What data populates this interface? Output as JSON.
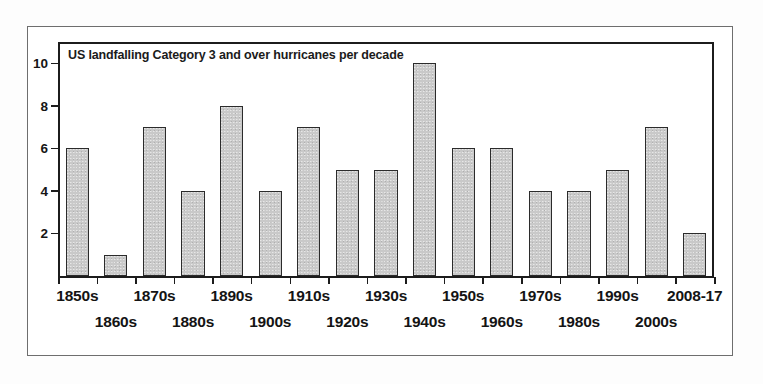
{
  "chart_data": {
    "type": "bar",
    "title": "US landfalling Category 3 and over hurricanes per decade",
    "xlabel": "",
    "ylabel": "",
    "ylim": [
      0,
      11
    ],
    "yticks": [
      2,
      4,
      6,
      8,
      10
    ],
    "grid": false,
    "legend": false,
    "categories": [
      "1850s",
      "1860s",
      "1870s",
      "1880s",
      "1890s",
      "1900s",
      "1910s",
      "1920s",
      "1930s",
      "1940s",
      "1950s",
      "1960s",
      "1970s",
      "1980s",
      "1990s",
      "2000s",
      "2008-17"
    ],
    "values": [
      6,
      1,
      7,
      4,
      8,
      4,
      7,
      5,
      5,
      10,
      6,
      6,
      4,
      4,
      5,
      7,
      2
    ],
    "bar_color": "#c9c9c9",
    "bar_edge_color": "#2b2b2b",
    "axis_color": "#1c1c1c",
    "background_color": "#ffffff"
  },
  "figure": {
    "frame_color": "#6e6e6e",
    "label_rows": [
      {
        "row": "top",
        "labels": [
          "1850s",
          "1870s",
          "1890s",
          "1910s",
          "1930s",
          "1950s",
          "1970s",
          "1990s",
          "2008-17"
        ]
      },
      {
        "row": "bottom",
        "labels": [
          "1860s",
          "1880s",
          "1900s",
          "1920s",
          "1940s",
          "1960s",
          "1980s",
          "2000s"
        ]
      }
    ]
  }
}
